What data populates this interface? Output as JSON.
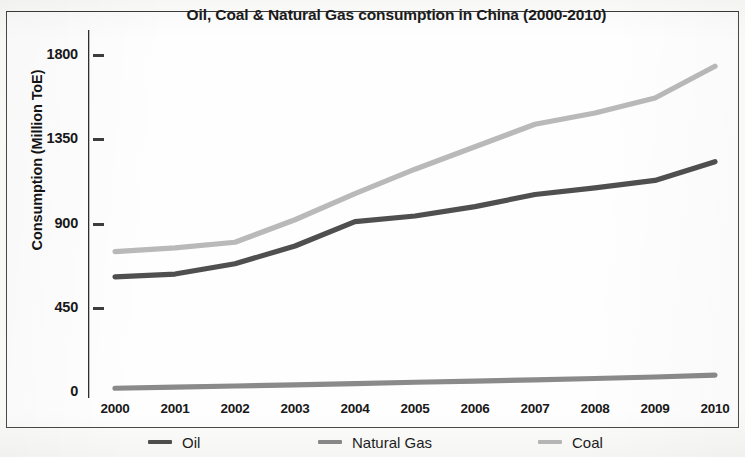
{
  "chart_data": {
    "type": "line",
    "title": "Oil, Coal & Natural Gas consumption in China (2000-2010)",
    "xlabel": "",
    "ylabel": "Consumption (Million ToE)",
    "categories": [
      "2000",
      "2001",
      "2002",
      "2003",
      "2004",
      "2005",
      "2006",
      "2007",
      "2008",
      "2009",
      "2010"
    ],
    "x": [
      2000,
      2001,
      2002,
      2003,
      2004,
      2005,
      2006,
      2007,
      2008,
      2009,
      2010
    ],
    "series": [
      {
        "name": "Coal",
        "color": "#b9b9b9",
        "values": [
          750,
          770,
          800,
          920,
          1060,
          1190,
          1310,
          1430,
          1490,
          1570,
          1740
        ]
      },
      {
        "name": "Oil",
        "color": "#4f4f4f",
        "values": [
          615,
          630,
          685,
          780,
          910,
          940,
          990,
          1055,
          1090,
          1130,
          1230
        ]
      },
      {
        "name": "Natural Gas",
        "color": "#8a8a8a",
        "values": [
          20,
          26,
          32,
          38,
          45,
          52,
          58,
          65,
          72,
          80,
          90
        ]
      }
    ],
    "ylim": [
      0,
      1800
    ],
    "yticks": [
      0,
      450,
      900,
      1350,
      1800
    ],
    "ytick_labels": [
      "0",
      "450",
      "900",
      "1350",
      "1800"
    ],
    "xlim": [
      2000,
      2010
    ],
    "grid": false,
    "legend_position": "bottom",
    "legend_entries": [
      {
        "label": "Oil",
        "color": "#4f4f4f"
      },
      {
        "label": "Natural Gas",
        "color": "#8a8a8a"
      },
      {
        "label": "Coal",
        "color": "#b9b9b9"
      }
    ],
    "axis_color": "#2e2e2e"
  }
}
